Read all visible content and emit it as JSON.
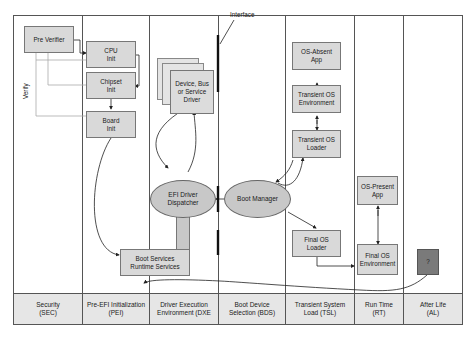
{
  "diagram": {
    "phases": [
      {
        "label": "Security\n(SEC)"
      },
      {
        "label": "Pre-EFI Initialization\n(PEI)"
      },
      {
        "label": "Driver Execution\nEnvironment (DXE"
      },
      {
        "label": "Boot Device\nSelection (BDS)"
      },
      {
        "label": "Transient System\nLoad (TSL)"
      },
      {
        "label": "Run Time\n(RT)"
      },
      {
        "label": "After Life\n(AL)"
      }
    ],
    "nodes": {
      "pre_verifier": "Pre Verifier",
      "cpu_init": "CPU\nInit",
      "chipset_init": "Chipset\nInit",
      "board_init": "Board\nInit",
      "device_driver": "Device, Bus\nor Service\nDriver",
      "efi_dispatcher": "EFI Driver\nDispatcher",
      "boot_services": "Boot Services\nRuntime Services",
      "boot_manager": "Boot Manager",
      "os_absent_app": "OS-Absent\nApp",
      "transient_os_env": "Transient OS\nEnvironment",
      "transient_os_loader": "Transient OS\nLoader",
      "final_os_loader": "Final OS\nLoader",
      "os_present_app": "OS-Present\nApp",
      "final_os_env": "Final OS\nEnvironment",
      "afterlife": "?"
    },
    "labels": {
      "interface": "Interface",
      "verify": "Verify"
    },
    "colors": {
      "box_fill": "#d9d9d9",
      "ellipse_fill": "#c8c8c8",
      "phase_fill": "#e6e6e6",
      "afterlife_fill": "#7a7a7a",
      "line": "#555555"
    }
  }
}
